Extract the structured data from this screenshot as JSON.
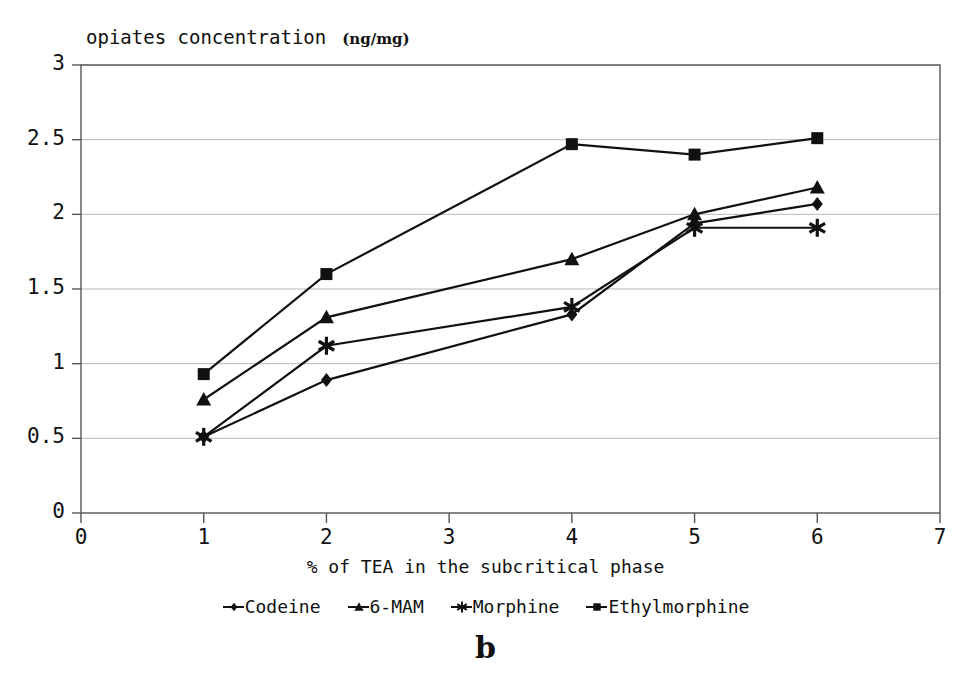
{
  "chart_data": {
    "type": "line",
    "title": "opiates concentration",
    "title_unit": "(ng/mg)",
    "xlabel": "% of TEA in the subcritical phase",
    "ylabel": "",
    "panel_label": "b",
    "x": [
      1,
      2,
      4,
      5,
      6
    ],
    "xlim": [
      0,
      7
    ],
    "ylim": [
      0,
      3
    ],
    "xticks": [
      "0",
      "1",
      "2",
      "3",
      "4",
      "5",
      "6",
      "7"
    ],
    "yticks": [
      "0",
      "0.5",
      "1",
      "1.5",
      "2",
      "2.5",
      "3"
    ],
    "grid": "horizontal",
    "legend_position": "below-axis",
    "series": [
      {
        "name": "Codeine",
        "marker": "diamond",
        "values": [
          0.51,
          0.89,
          1.33,
          1.94,
          2.07
        ]
      },
      {
        "name": "6-MAM",
        "marker": "triangle",
        "values": [
          0.76,
          1.31,
          1.7,
          2.0,
          2.18
        ]
      },
      {
        "name": "Morphine",
        "marker": "asterisk",
        "values": [
          0.51,
          1.12,
          1.38,
          1.91,
          1.91
        ]
      },
      {
        "name": "Ethylmorphine",
        "marker": "square",
        "values": [
          0.93,
          1.6,
          2.47,
          2.4,
          2.51
        ]
      }
    ],
    "colors": {
      "line": "#111111",
      "grid": "#b8b8b8",
      "axis": "#555555",
      "background": "#ffffff"
    }
  }
}
